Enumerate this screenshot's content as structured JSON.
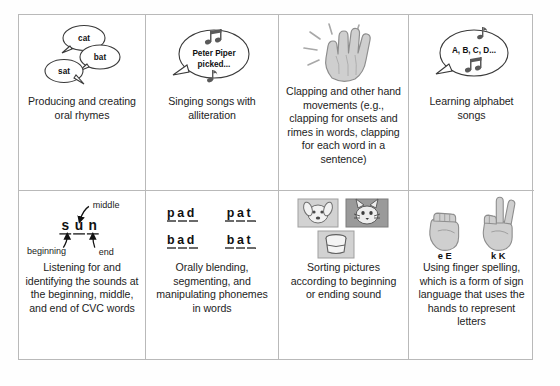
{
  "poster": {
    "title": "Phonological Awareness Activities",
    "layout": {
      "columns": 4,
      "rows": 2
    }
  },
  "cells": [
    {
      "id": "producing-rhymes",
      "art": "speech-bubbles-rhyming-words",
      "bubbles": [
        "cat",
        "bat",
        "sat"
      ],
      "caption": "Producing and creating oral rhymes"
    },
    {
      "id": "singing-alliteration",
      "art": "speech-bubble-with-music-notes",
      "bubble_line1": "Peter Piper",
      "bubble_line2": "picked...",
      "caption": "Singing songs with alliteration"
    },
    {
      "id": "clapping-hand-movements",
      "art": "clapping-hand",
      "caption": "Clapping and other hand movements (e.g., clapping for onsets and rimes in words, clapping for each word in a sentence)"
    },
    {
      "id": "alphabet-songs",
      "art": "speech-bubble-alphabet",
      "bubble_line1": "A, B, C, D...",
      "caption": "Learning alphabet songs"
    },
    {
      "id": "cvc-sounds",
      "art": "sun-phoneme-diagram",
      "word": "sun",
      "letters": [
        "s",
        "u",
        "n"
      ],
      "labels": {
        "middle": "middle",
        "beginning": "beginning",
        "end": "end"
      },
      "caption": "Listening for and identifying the sounds at the beginning, middle, and end of CVC words"
    },
    {
      "id": "blending-segmenting",
      "art": "word-family-grid",
      "words": [
        [
          "pad",
          "pat"
        ],
        [
          "bad",
          "bat"
        ]
      ],
      "caption": "Orally blending, segmenting, and manipulating phonemes in words"
    },
    {
      "id": "sorting-pictures",
      "art": "picture-cards-dog-cat-cup",
      "cards": [
        "dog",
        "cat",
        "cup"
      ],
      "caption": "Sorting pictures according to beginning or ending sound"
    },
    {
      "id": "finger-spelling",
      "art": "asl-hand-signs",
      "signs": [
        "e E",
        "k K"
      ],
      "caption": "Using finger spelling, which is a form of sign language that uses the hands to represent letters"
    }
  ],
  "colors": {
    "border": "#b9b9b9",
    "text": "#1d1d1d",
    "hand_fill": "#cfcfcf",
    "hand_stroke": "#8d8d8d",
    "card_light": "#d2d2d2",
    "card_dark": "#9a9a9a"
  }
}
